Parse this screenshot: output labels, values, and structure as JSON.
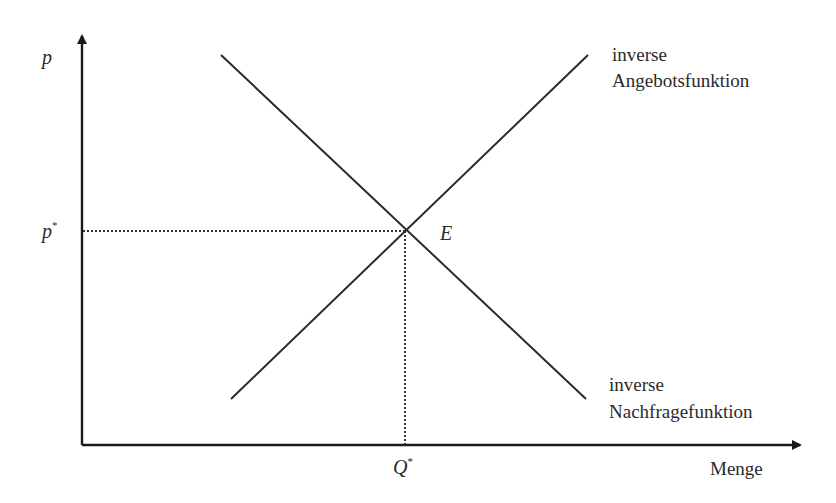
{
  "diagram": {
    "type": "supply-demand-equilibrium",
    "axes": {
      "y_label": "p",
      "x_label": "Menge"
    },
    "equilibrium": {
      "point_label": "E",
      "price_label": "p",
      "price_superscript": "*",
      "quantity_label": "Q",
      "quantity_superscript": "*"
    },
    "curves": [
      {
        "name": "supply",
        "label_line1": "inverse",
        "label_line2": "Angebotsfunktion",
        "slope": "rising"
      },
      {
        "name": "demand",
        "label_line1": "inverse",
        "label_line2": "Nachfragefunktion",
        "slope": "falling"
      }
    ],
    "colors": {
      "line": "#2a2a2a",
      "text": "#2a2a2a",
      "background": "#ffffff"
    }
  }
}
